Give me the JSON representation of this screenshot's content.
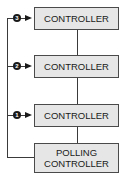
{
  "diagram": {
    "boxes": [
      {
        "label": "CONTROLLER",
        "badge": "3"
      },
      {
        "label": "CONTROLLER",
        "badge": "2"
      },
      {
        "label": "CONTROLLER",
        "badge": "1"
      },
      {
        "label_line1": "POLLING",
        "label_line2": "CONTROLLER"
      }
    ],
    "colors": {
      "box_fill": "#e6e6e6",
      "line": "#3a3a3a",
      "badge": "#1a1a1a"
    }
  }
}
